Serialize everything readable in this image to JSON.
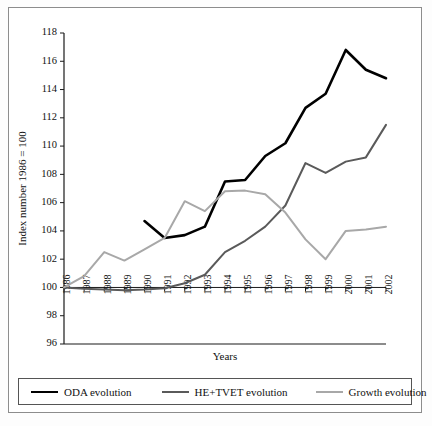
{
  "chart_data": {
    "type": "line",
    "title": "",
    "xlabel": "Years",
    "ylabel": "Index number 1986 = 100",
    "x": [
      1986,
      1987,
      1988,
      1989,
      1990,
      1991,
      1992,
      1993,
      1994,
      1995,
      1996,
      1997,
      1998,
      1999,
      2000,
      2001,
      2002
    ],
    "categories": [
      "1986",
      "1987",
      "1988",
      "1989",
      "1990",
      "1991",
      "1992",
      "1993",
      "1994",
      "1995",
      "1996",
      "1997",
      "1998",
      "1999",
      "2000",
      "2001",
      "2002"
    ],
    "xlim": [
      1986,
      2002
    ],
    "ylim": [
      96,
      118
    ],
    "yticks": [
      96,
      98,
      100,
      102,
      104,
      106,
      108,
      110,
      112,
      114,
      116,
      118
    ],
    "grid": false,
    "legend_position": "bottom",
    "series": [
      {
        "name": "ODA evolution",
        "color": "#000000",
        "width": 2.6,
        "x": [
          1990,
          1991,
          1992,
          1993,
          1994,
          1995,
          1996,
          1997,
          1998,
          1999,
          2000,
          2001,
          2002
        ],
        "values": [
          104.7,
          103.5,
          103.7,
          104.3,
          107.5,
          107.6,
          109.3,
          110.2,
          112.7,
          113.7,
          116.8,
          115.4,
          114.8
        ]
      },
      {
        "name": "HE+TVET evolution",
        "color": "#5a5a5a",
        "width": 2.0,
        "x": [
          1986,
          1987,
          1988,
          1989,
          1990,
          1991,
          1992,
          1993,
          1994,
          1995,
          1996,
          1997,
          1998,
          1999,
          2000,
          2001,
          2002
        ],
        "values": [
          100.0,
          99.9,
          99.85,
          99.8,
          99.85,
          99.95,
          100.3,
          100.9,
          102.5,
          103.3,
          104.3,
          105.8,
          108.8,
          108.1,
          108.9,
          109.2,
          111.5
        ]
      },
      {
        "name": "Growth evolution",
        "color": "#a8a8a8",
        "width": 2.0,
        "x": [
          1986,
          1987,
          1988,
          1989,
          1990,
          1991,
          1992,
          1993,
          1994,
          1995,
          1996,
          1997,
          1998,
          1999,
          2000,
          2001,
          2002
        ],
        "values": [
          100.0,
          100.8,
          102.5,
          101.9,
          102.7,
          103.5,
          106.1,
          105.4,
          106.8,
          106.85,
          106.6,
          105.3,
          103.4,
          102.0,
          104.0,
          104.1,
          104.3
        ]
      }
    ]
  },
  "legend": {
    "items": [
      {
        "label": "ODA evolution"
      },
      {
        "label": "HE+TVET evolution"
      },
      {
        "label": "Growth evolution"
      }
    ]
  }
}
